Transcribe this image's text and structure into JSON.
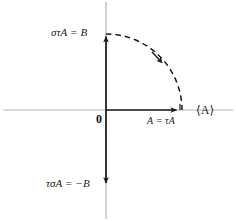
{
  "figure": {
    "width": 236,
    "height": 221,
    "background": "#ffffff"
  },
  "labels": {
    "top_left": "στA = B",
    "bottom_left": "τσA = −B",
    "x_point": "A = τA",
    "x_axis": "⟨A⟩",
    "origin": "0"
  },
  "colors": {
    "axis": "#b3b3b3",
    "vector": "#1a1a1a",
    "arc": "#1a1a1a",
    "text": "#1a1a1a",
    "background": "#ffffff"
  },
  "geometry": {
    "origin": {
      "x": 106,
      "y": 110
    },
    "axis_vertical_x": 106,
    "axis_horizontal_y": 110,
    "point_top": {
      "x": 106,
      "y": 33
    },
    "point_right": {
      "x": 180,
      "y": 110
    },
    "point_bottom": {
      "x": 106,
      "y": 186
    },
    "arc_radius": 76,
    "arc_direction": "clockwise",
    "arc_style": "dashed",
    "arc_arrow_at": {
      "x": 158,
      "y": 58
    }
  }
}
